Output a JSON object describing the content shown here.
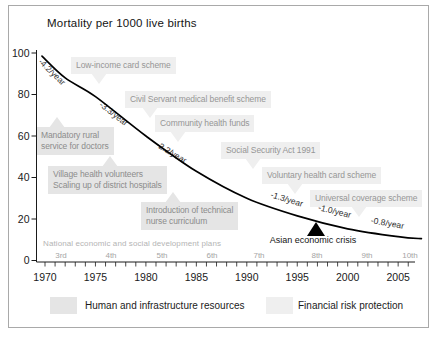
{
  "title": "Mortality per 1000 live births",
  "legend": {
    "human": {
      "label": "Human and infrastructure resources",
      "color": "#e5e5e5"
    },
    "financial": {
      "label": "Financial risk protection",
      "color": "#efefef"
    }
  },
  "colors": {
    "human_box": "#e5e5e5",
    "human_text": "#8c8c8c",
    "financial_box": "#efefef",
    "financial_text": "#969696",
    "curve": "#000000",
    "axis": "#1a1a1a",
    "plan_text": "#a5a5a5",
    "plans_title_text": "#b4b4b4"
  },
  "chart_data": {
    "type": "line",
    "title": "Mortality per 1000 live births",
    "ylabel": "Mortality per 1000 live births",
    "xlim": [
      1969.5,
      2007.5
    ],
    "ylim": [
      0,
      100
    ],
    "grid": false,
    "legend_position": "bottom",
    "x": [
      1969.7,
      1972,
      1975,
      1980,
      1985,
      1990,
      1995,
      2000,
      2005,
      2007.3
    ],
    "series": [
      {
        "name": "Mortality per 1000 live births",
        "values": [
          98.5,
          88,
          79,
          60,
          43,
          30,
          21.5,
          15.3,
          11.5,
          10.5
        ]
      }
    ],
    "xticks": [
      1970,
      1975,
      1980,
      1985,
      1990,
      1995,
      2000,
      2005
    ],
    "yticks": [
      0,
      20,
      40,
      60,
      80,
      100
    ],
    "rate_labels": [
      {
        "text": "-4.2/year",
        "x": 50,
        "y": 74,
        "rot": 44
      },
      {
        "text": "-3.3/year",
        "x": 112,
        "y": 116,
        "rot": 38
      },
      {
        "text": "-2.2/year",
        "x": 170,
        "y": 155,
        "rot": 31
      },
      {
        "text": "-1.3/year",
        "x": 286,
        "y": 202,
        "rot": 17
      },
      {
        "text": "-1.0/year",
        "x": 334,
        "y": 214,
        "rot": 14
      },
      {
        "text": "-0.8/year",
        "x": 387,
        "y": 226,
        "rot": 10
      }
    ],
    "plans": {
      "title": "National economic and social development plans",
      "items": [
        {
          "label": "3rd",
          "x": 61
        },
        {
          "label": "4th",
          "x": 111
        },
        {
          "label": "5th",
          "x": 162
        },
        {
          "label": "6th",
          "x": 212
        },
        {
          "label": "7th",
          "x": 259
        },
        {
          "label": "8th",
          "x": 317
        },
        {
          "label": "9th",
          "x": 367
        },
        {
          "label": "10th",
          "x": 410
        }
      ]
    },
    "event": {
      "label": "Asian economic crisis",
      "year": 1997,
      "marker": "filled-up-triangle"
    },
    "annotations": [
      {
        "text": "Low-income card scheme",
        "category": "financial",
        "x": 71,
        "y": 57,
        "tail": "down",
        "tail_x": 99
      },
      {
        "text": "Civil Servant medical benefit scheme",
        "category": "financial",
        "x": 125,
        "y": 91,
        "tail": "down",
        "tail_x": 150
      },
      {
        "text": "Community health funds",
        "category": "financial",
        "x": 155,
        "y": 115,
        "tail": "down",
        "tail_x": 178
      },
      {
        "text": "Social Security Act 1991",
        "category": "financial",
        "x": 221,
        "y": 142,
        "tail": "down",
        "tail_x": 253
      },
      {
        "text": "Voluntary health card scheme",
        "category": "financial",
        "x": 262,
        "y": 167,
        "tail": "down",
        "tail_x": 295
      },
      {
        "text": "Universal coverage scheme",
        "category": "financial",
        "x": 310,
        "y": 190,
        "tail": "down",
        "tail_x": 359
      },
      {
        "text": "Mandatory rural\nservice for doctors",
        "category": "human",
        "x": 36,
        "y": 127,
        "tail": "up",
        "tail_x": 57
      },
      {
        "text": "Village health volunteers\nScaling up of district hospitals",
        "category": "human",
        "x": 48,
        "y": 166,
        "tail": "up",
        "tail_x": 110
      },
      {
        "text": "Introduction of technical\nnurse curriculum",
        "category": "human",
        "x": 141,
        "y": 202,
        "tail": "up",
        "tail_x": 173
      }
    ]
  }
}
